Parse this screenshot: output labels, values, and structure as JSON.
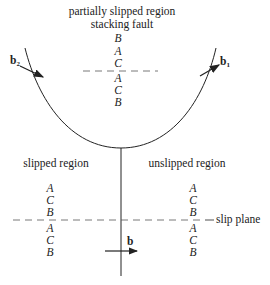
{
  "top": {
    "title_line1": "partially slipped region",
    "title_line2": "stacking fault",
    "stack_above": [
      "B",
      "A",
      "C"
    ],
    "stack_below": [
      "A",
      "C",
      "B"
    ]
  },
  "partials": {
    "left": {
      "label": "b",
      "subscript": "2"
    },
    "right": {
      "label": "b",
      "subscript": "1"
    }
  },
  "bottom": {
    "left_region": "slipped region",
    "right_region": "unslipped region",
    "left_stack_above": [
      "A",
      "C",
      "B"
    ],
    "left_stack_below": [
      "A",
      "C",
      "B"
    ],
    "right_stack_above": [
      "A",
      "C",
      "B"
    ],
    "right_stack_below": [
      "A",
      "C",
      "B"
    ],
    "slip_plane_label": "slip plane",
    "burgers_label": "b"
  },
  "colors": {
    "line": "#222222",
    "dash": "#555555"
  }
}
